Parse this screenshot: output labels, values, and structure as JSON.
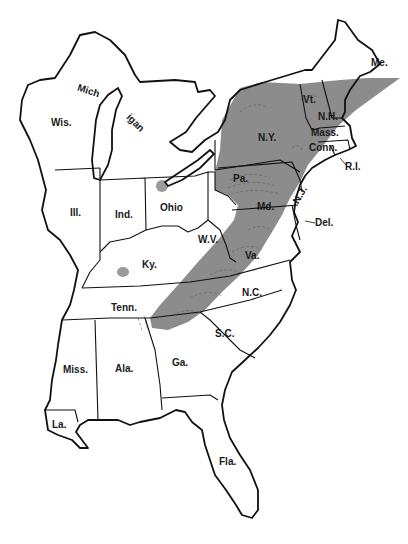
{
  "map": {
    "title": "",
    "shading_color": "#8c8c8c",
    "outline_color": "#111111",
    "background": "#ffffff",
    "shaded_region": "Appalachian belt from Tennessee/Georgia northeast through Va., W.V., Md., Pa., N.Y., Vt., N.H. to Me.",
    "isolated_spots": [
      {
        "state": "Ohio",
        "x": 162,
        "y": 186
      },
      {
        "state": "Ky.",
        "x": 123,
        "y": 272
      }
    ],
    "labels": {
      "me": "Me.",
      "vt": "Vt.",
      "nh": "N.H.",
      "mass": "Mass.",
      "conn": "Conn.",
      "ri": "R.I.",
      "ny": "N.Y.",
      "pa": "Pa.",
      "nj": "N.J.",
      "md": "Md.",
      "del": "Del.",
      "wv": "W.V.",
      "va": "Va.",
      "nc": "N.C.",
      "sc": "S.C.",
      "ga": "Ga.",
      "fla": "Fla.",
      "ala": "Ala.",
      "miss": "Miss.",
      "la": "La.",
      "tenn": "Tenn.",
      "ky": "Ky.",
      "ohio": "Ohio",
      "ind": "Ind.",
      "ill": "Ill.",
      "wis": "Wis.",
      "mich_1": "Mich",
      "mich_2": "igan"
    }
  }
}
